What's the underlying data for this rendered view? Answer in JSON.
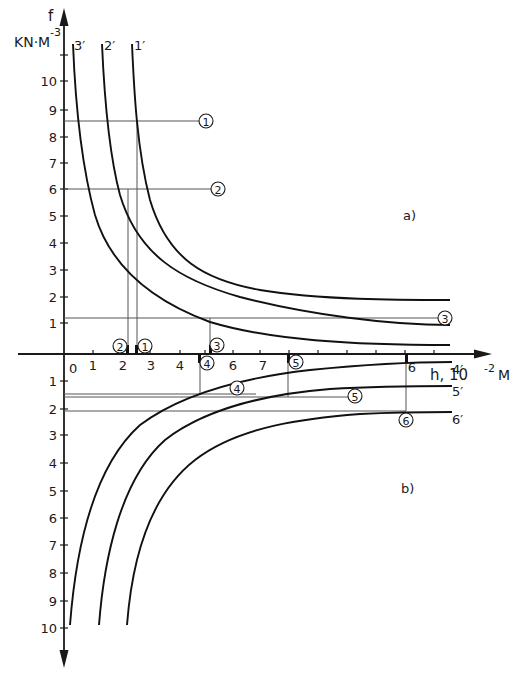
{
  "figure": {
    "y_axis": {
      "name": "f",
      "unit": "KN·M",
      "unit_exp": "-3",
      "upper_ticks": [
        "1",
        "2",
        "3",
        "4",
        "5",
        "6",
        "7",
        "8",
        "9",
        "10"
      ],
      "lower_ticks": [
        "1",
        "2",
        "3",
        "4",
        "5",
        "6",
        "7",
        "8",
        "9",
        "10"
      ]
    },
    "x_axis": {
      "name": "h, 10",
      "unit_exp": "-2",
      "unit": "M",
      "origin_label": "0",
      "ticks": [
        "1",
        "2",
        "3",
        "4",
        "5",
        "6",
        "7"
      ],
      "far_tick_label": "6",
      "end_label": "4′"
    },
    "panels": {
      "upper": "a)",
      "lower": "b)"
    },
    "curve_labels": {
      "c1": "1′",
      "c2": "2′",
      "c3": "3′",
      "c4": "4′",
      "c5": "5′",
      "c6": "6′"
    },
    "markers": {
      "m1": "1",
      "m2": "2",
      "m3": "3",
      "m4": "4",
      "m5": "5",
      "m6": "6"
    }
  },
  "chart_data": {
    "type": "line",
    "title": "",
    "xlabel": "h, 10^-2 M",
    "ylabel": "f, KN·M^-3",
    "xlim": [
      0,
      14
    ],
    "ylim": [
      -10,
      10.5
    ],
    "grid": false,
    "panels": [
      {
        "name": "a)",
        "region": "f > 0",
        "series": [
          {
            "name": "1′",
            "x": [
              3.1,
              3.3,
              3.6,
              4.2,
              5.0,
              6.5,
              8.5,
              11.0,
              13.5
            ],
            "y": [
              10.8,
              8.6,
              6.1,
              4.4,
              3.6,
              2.9,
              2.4,
              2.15,
              2.05
            ]
          },
          {
            "name": "2′",
            "x": [
              2.2,
              2.4,
              2.7,
              3.3,
              4.2,
              6.0,
              8.5,
              11.0,
              13.5
            ],
            "y": [
              10.8,
              8.6,
              6.1,
              4.4,
              3.3,
              2.3,
              1.6,
              1.25,
              1.15
            ]
          },
          {
            "name": "3′",
            "x": [
              1.3,
              1.5,
              1.8,
              2.3,
              3.0,
              4.4,
              6.5,
              9.5,
              13.5
            ],
            "y": [
              10.8,
              8.6,
              6.1,
              4.0,
              2.8,
              1.8,
              0.9,
              0.4,
              0.3
            ]
          }
        ],
        "construction_lines": [
          {
            "marker": "1",
            "f": 8.6,
            "h": 2.5
          },
          {
            "marker": "2",
            "f": 6.1,
            "h": 2.2
          },
          {
            "marker": "3",
            "f": 1.35,
            "h": 5.1
          }
        ]
      },
      {
        "name": "b)",
        "region": "f < 0 (plotted downward)",
        "series": [
          {
            "name": "4′",
            "x": [
              1.0,
              1.6,
              2.6,
              3.8,
              4.7,
              6.5,
              9.0,
              11.5,
              13.5
            ],
            "y": [
              -9.9,
              -7.0,
              -4.0,
              -2.2,
              -1.45,
              -0.8,
              -0.4,
              -0.2,
              -0.15
            ]
          },
          {
            "name": "5′",
            "x": [
              1.8,
              2.5,
              3.6,
              5.0,
              6.5,
              8.0,
              10.0,
              12.0,
              13.5
            ],
            "y": [
              -9.9,
              -7.0,
              -4.2,
              -2.6,
              -1.9,
              -1.45,
              -1.2,
              -1.05,
              -1.0
            ]
          },
          {
            "name": "6′",
            "x": [
              2.7,
              3.4,
              4.6,
              6.2,
              7.8,
              9.5,
              11.0,
              12.4,
              13.5
            ],
            "y": [
              -9.9,
              -7.0,
              -4.3,
              -3.0,
              -2.55,
              -2.3,
              -2.15,
              -2.08,
              -2.05
            ]
          }
        ],
        "construction_lines": [
          {
            "marker": "4",
            "f": -1.45,
            "h": 4.7
          },
          {
            "marker": "5",
            "f": -1.5,
            "h": 7.8
          },
          {
            "marker": "6",
            "f": -2.1,
            "h": 11.9
          }
        ]
      }
    ]
  }
}
